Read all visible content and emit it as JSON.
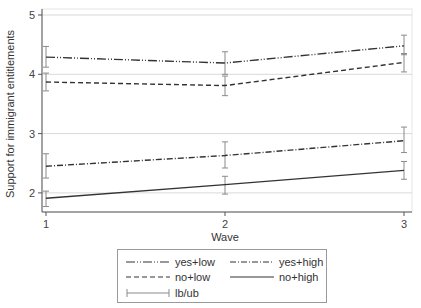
{
  "chart_data": {
    "type": "line",
    "title": "",
    "xlabel": "Wave",
    "ylabel": "Support for immigrant entitlements",
    "x": [
      1,
      2,
      3
    ],
    "x_ticks": [
      "1",
      "2",
      "3"
    ],
    "y_ticks": [
      "2",
      "3",
      "4",
      "5"
    ],
    "xlim": [
      1,
      3
    ],
    "ylim": [
      1.7,
      5.05
    ],
    "grid": true,
    "legend_position": "bottom",
    "series": [
      {
        "name": "yes+low",
        "style": "dash-dot-dot",
        "values": [
          4.29,
          4.19,
          4.48
        ],
        "lb": [
          4.12,
          4.0,
          4.33
        ],
        "ub": [
          4.47,
          4.38,
          4.66
        ]
      },
      {
        "name": "no+low",
        "style": "dashed",
        "values": [
          3.87,
          3.81,
          4.2
        ],
        "lb": [
          3.72,
          3.64,
          4.04
        ],
        "ub": [
          4.02,
          3.97,
          4.35
        ]
      },
      {
        "name": "yes+high",
        "style": "dash-dot",
        "values": [
          2.45,
          2.63,
          2.88
        ],
        "lb": [
          2.25,
          2.42,
          2.68
        ],
        "ub": [
          2.66,
          2.86,
          3.11
        ]
      },
      {
        "name": "no+high",
        "style": "solid",
        "values": [
          1.91,
          2.14,
          2.38
        ],
        "lb": [
          1.77,
          1.98,
          2.23
        ],
        "ub": [
          2.03,
          2.28,
          2.53
        ]
      }
    ],
    "error_bar_label": "lb/ub"
  },
  "legend": {
    "items": [
      {
        "label": "yes+low"
      },
      {
        "label": "yes+high"
      },
      {
        "label": "no+low"
      },
      {
        "label": "no+high"
      },
      {
        "label": "lb/ub"
      }
    ]
  },
  "colors": {
    "line": "#333333",
    "error_bar": "#8a8a8a",
    "grid": "#d9d9d9",
    "axis": "#555555"
  }
}
